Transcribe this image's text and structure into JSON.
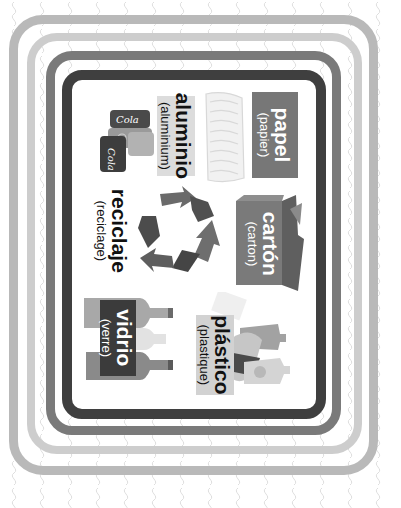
{
  "poster": {
    "theme": "reciclaje",
    "orientation": "rotated-90-clockwise",
    "colors": {
      "background": "#ffffff",
      "pattern_squiggle": "#dedede",
      "frame_outer": "#b9b9b9",
      "frame_second": "#cdcdcd",
      "frame_third": "#7a7a7a",
      "frame_inner": "#3f3f3f",
      "card_fill": "#ffffff"
    },
    "items": [
      {
        "id": "papel",
        "label": "papel",
        "translation": "(papier)",
        "icon": "paper-stack-icon",
        "box_color": "#777777",
        "text_color": "#ffffff"
      },
      {
        "id": "aluminio",
        "label": "aluminio",
        "translation": "(aluminium)",
        "icon": "soda-cans-icon",
        "box_color": "#dcdcdc",
        "text_color": "#111111"
      },
      {
        "id": "carton",
        "label": "cartón",
        "translation": "(carton)",
        "icon": "cardboard-box-icon",
        "box_color": "#6e6e6e",
        "text_color": "#ffffff"
      },
      {
        "id": "reciclaje",
        "label": "reciclaje",
        "translation": "(reciclage)",
        "icon": "recycle-arrows-icon",
        "box_color": null,
        "text_color": "#111111"
      },
      {
        "id": "vidrio",
        "label": "vidrio",
        "translation": "(verre)",
        "icon": "glass-bottles-icon",
        "box_color": "#3b3b3b",
        "text_color": "#ffffff"
      },
      {
        "id": "plastico",
        "label": "plástico",
        "translation": "(plastique)",
        "icon": "plastic-bottles-icon",
        "box_color": "#d2d2d2",
        "text_color": "#111111"
      }
    ],
    "can_text": "Cola"
  }
}
